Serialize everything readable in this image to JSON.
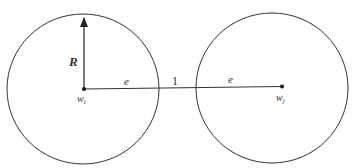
{
  "diagram": {
    "labels": {
      "radius": "R",
      "left_segment": "e",
      "middle_segment": "1",
      "right_segment": "e",
      "left_center": "w",
      "left_center_sub": "i",
      "right_center": "w",
      "right_center_sub": "j"
    },
    "colors": {
      "stroke": "#333333",
      "background": "#ffffff"
    }
  }
}
